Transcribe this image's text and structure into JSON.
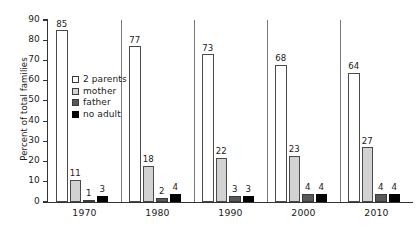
{
  "chart_data": {
    "type": "bar",
    "title": "",
    "xlabel": "",
    "ylabel": "Percent of total families",
    "ylim": [
      0,
      90
    ],
    "yticks": [
      0,
      10,
      20,
      30,
      40,
      50,
      60,
      70,
      80,
      90
    ],
    "grid": false,
    "legend_position": "inside-upper-left",
    "categories": [
      "1970",
      "1980",
      "1990",
      "2000",
      "2010"
    ],
    "series": [
      {
        "name": "2 parents",
        "color": "#ffffff",
        "values": [
          85,
          77,
          73,
          68,
          64
        ]
      },
      {
        "name": "mother",
        "color": "#d2d2d2",
        "values": [
          11,
          18,
          22,
          23,
          27
        ]
      },
      {
        "name": "father",
        "color": "#585858",
        "values": [
          1,
          2,
          3,
          4,
          4
        ]
      },
      {
        "name": "no adult",
        "color": "#000000",
        "values": [
          3,
          4,
          3,
          4,
          4
        ]
      }
    ],
    "data_labels": [
      [
        "85",
        "11",
        "1",
        "3"
      ],
      [
        "77",
        "18",
        "2",
        "4"
      ],
      [
        "73",
        "22",
        "3",
        "3"
      ],
      [
        "68",
        "23",
        "4",
        "4"
      ],
      [
        "64",
        "27",
        "4",
        "4"
      ]
    ]
  }
}
